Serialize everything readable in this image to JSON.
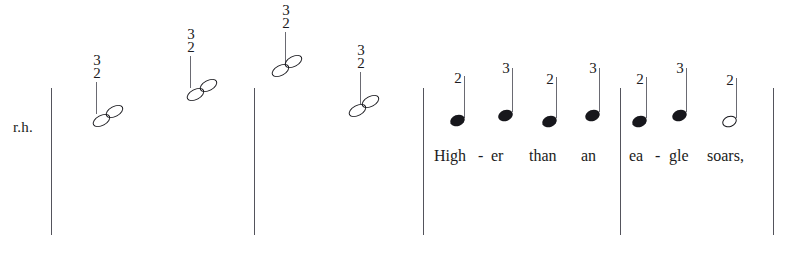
{
  "score": {
    "hand_label": "r.h.",
    "ink_color": "#17171c",
    "barline_color": "#54545c",
    "background_color": "#ffffff",
    "barlines": [
      {
        "name": "barline-1",
        "x": 51,
        "y": 88,
        "height": 147
      },
      {
        "name": "barline-2",
        "x": 254,
        "y": 88,
        "height": 147
      },
      {
        "name": "barline-3",
        "x": 423,
        "y": 88,
        "height": 147
      },
      {
        "name": "barline-4",
        "x": 620,
        "y": 88,
        "height": 147
      },
      {
        "name": "barline-5",
        "x": 773,
        "y": 88,
        "height": 147
      }
    ],
    "dyad_notes": [
      {
        "fingering_upper": "3",
        "fingering_lower": "2",
        "x": 96,
        "num_y": 54,
        "stem_y": 82,
        "stem_height": 32,
        "head_x": 92,
        "head_y": 104
      },
      {
        "fingering_upper": "3",
        "fingering_lower": "2",
        "x": 190,
        "num_y": 28,
        "stem_y": 56,
        "stem_height": 32,
        "head_x": 186,
        "head_y": 78
      },
      {
        "fingering_upper": "3",
        "fingering_lower": "2",
        "x": 285,
        "num_y": 4,
        "stem_y": 32,
        "stem_height": 32,
        "head_x": 271,
        "head_y": 54
      },
      {
        "fingering_upper": "3",
        "fingering_lower": "2",
        "x": 360,
        "num_y": 44,
        "stem_y": 72,
        "stem_height": 32,
        "head_x": 348,
        "head_y": 94
      }
    ],
    "melody_notes": [
      {
        "fingering": "2",
        "head_type": "filled",
        "head_x": 450,
        "head_y": 115,
        "stem_x": 464,
        "stem_y": 76,
        "stem_height": 42,
        "num_x": 458,
        "num_y": 72
      },
      {
        "fingering": "3",
        "head_type": "filled",
        "head_x": 498,
        "head_y": 110,
        "stem_x": 512,
        "stem_y": 68,
        "stem_height": 44,
        "num_x": 506,
        "num_y": 62
      },
      {
        "fingering": "2",
        "head_type": "filled",
        "head_x": 542,
        "head_y": 116,
        "stem_x": 556,
        "stem_y": 77,
        "stem_height": 41,
        "num_x": 550,
        "num_y": 73
      },
      {
        "fingering": "3",
        "head_type": "filled",
        "head_x": 585,
        "head_y": 110,
        "stem_x": 599,
        "stem_y": 68,
        "stem_height": 44,
        "num_x": 593,
        "num_y": 62
      },
      {
        "fingering": "2",
        "head_type": "filled",
        "head_x": 632,
        "head_y": 116,
        "stem_x": 646,
        "stem_y": 77,
        "stem_height": 41,
        "num_x": 640,
        "num_y": 73
      },
      {
        "fingering": "3",
        "head_type": "filled",
        "head_x": 672,
        "head_y": 110,
        "stem_x": 686,
        "stem_y": 68,
        "stem_height": 44,
        "num_x": 680,
        "num_y": 62
      },
      {
        "fingering": "2",
        "head_type": "hollow",
        "head_x": 722,
        "head_y": 116,
        "stem_x": 736,
        "stem_y": 78,
        "stem_height": 40,
        "num_x": 730,
        "num_y": 74
      }
    ],
    "lyrics": [
      {
        "text": "High",
        "x": 434,
        "y": 147
      },
      {
        "text": "-",
        "x": 478,
        "y": 147
      },
      {
        "text": "er",
        "x": 491,
        "y": 147
      },
      {
        "text": "than",
        "x": 529,
        "y": 147
      },
      {
        "text": "an",
        "x": 581,
        "y": 147
      },
      {
        "text": "ea",
        "x": 629,
        "y": 147
      },
      {
        "text": "-",
        "x": 655,
        "y": 147
      },
      {
        "text": "gle",
        "x": 669,
        "y": 147
      },
      {
        "text": "soars,",
        "x": 707,
        "y": 147
      }
    ],
    "hand_label_pos": {
      "x": 13,
      "y": 119
    }
  }
}
